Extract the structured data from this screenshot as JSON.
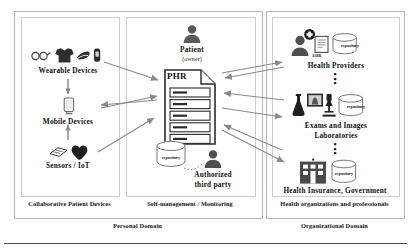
{
  "diagram": {
    "domains": [
      {
        "id": "personal",
        "label": "Personal Domain"
      },
      {
        "id": "organizational",
        "label": "Organizational Domain"
      }
    ],
    "panels": [
      {
        "id": "collaborative",
        "label": "Collaborative Patient Devices"
      },
      {
        "id": "selfmanagement",
        "label": "Self-management / Monitoring"
      },
      {
        "id": "healthorgs",
        "label": "Health organizations and professionals"
      }
    ],
    "nodes": {
      "wearable": {
        "label": "Wearable Devices",
        "icons": [
          "glasses-icon",
          "tshirt-icon",
          "shoe-icon",
          "wristband-icon"
        ]
      },
      "mobile": {
        "label": "Mobile Devices",
        "icons": [
          "smartphone-icon"
        ]
      },
      "sensors": {
        "label": "Sensors / IoT",
        "icons": [
          "chip-sensor-icon",
          "heart-icon"
        ]
      },
      "patient": {
        "label": "Patient",
        "sublabel": "(owner)",
        "icons": [
          "person-icon"
        ]
      },
      "phr": {
        "label": "PHR",
        "rows": 5,
        "repository_label": "repository",
        "icons": [
          "document-icon",
          "database-cylinder-icon"
        ]
      },
      "third_party": {
        "label_line1": "Authorized",
        "label_line2": "third  party",
        "icons": [
          "person-icon"
        ]
      },
      "providers": {
        "label": "Health Providers",
        "ehr_label": "EHR",
        "repository_label": "repository",
        "icons": [
          "person-with-medical-cross-icon",
          "ehr-document-icon",
          "database-cylinder-icon"
        ]
      },
      "labs": {
        "label_line1": "Exams and Images",
        "label_line2": "Laboratories",
        "repository_label": "repository",
        "icons": [
          "flask-icon",
          "xray-image-icon",
          "microscope-icon",
          "database-cylinder-icon"
        ]
      },
      "insurance": {
        "label": "Health Insurance,  Government",
        "repository_label": "repository",
        "icons": [
          "building-icon",
          "database-cylinder-icon"
        ]
      }
    },
    "connectors": {
      "vertical_flow": [
        "wearable-to-mobile-arrow",
        "sensors-to-mobile-arrow"
      ],
      "exchange": [
        "wearable-to-phr-arrow",
        "phr-to-mobile-arrow",
        "mobile-to-phr-arrow",
        "sensors-to-phr-arrow",
        "phr-to-providers-arrow",
        "providers-to-phr-arrow",
        "phr-to-labs-arrow",
        "labs-to-phr-arrow",
        "phr-to-insurance-arrow",
        "insurance-to-phr-arrow"
      ],
      "dotted": [
        "repository-to-third-party-link"
      ]
    },
    "colors": {
      "arrow": "#7b7b7b",
      "icon_dark": "#4a4a4a",
      "icon_mid": "#6e6e6e",
      "frame": "#bcbcbc",
      "text": "#111111"
    }
  }
}
